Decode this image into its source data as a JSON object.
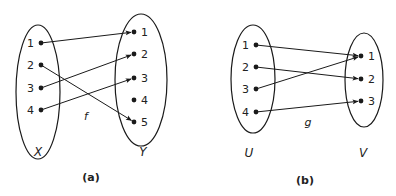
{
  "diagrams": [
    {
      "id": "a",
      "caption": "(a)",
      "function_label": "f",
      "domain": {
        "label": "X",
        "ellipse": {
          "cx": 38,
          "cy": 92,
          "rx": 22,
          "ry": 67
        },
        "elements": [
          {
            "label": "1",
            "x": 41,
            "y": 43
          },
          {
            "label": "2",
            "x": 41,
            "y": 65
          },
          {
            "label": "3",
            "x": 41,
            "y": 88
          },
          {
            "label": "4",
            "x": 41,
            "y": 110
          }
        ],
        "label_pos": {
          "x": 38,
          "y": 156
        }
      },
      "codomain": {
        "label": "Y",
        "ellipse": {
          "cx": 141,
          "cy": 80,
          "rx": 26,
          "ry": 66
        },
        "elements": [
          {
            "label": "1",
            "x": 134,
            "y": 32
          },
          {
            "label": "2",
            "x": 134,
            "y": 54
          },
          {
            "label": "3",
            "x": 134,
            "y": 78
          },
          {
            "label": "4",
            "x": 134,
            "y": 100
          },
          {
            "label": "5",
            "x": 134,
            "y": 122
          }
        ],
        "label_pos": {
          "x": 143,
          "y": 156
        }
      },
      "mapping": [
        {
          "from": "1",
          "to": "1"
        },
        {
          "from": "2",
          "to": "5"
        },
        {
          "from": "3",
          "to": "2"
        },
        {
          "from": "4",
          "to": "3"
        }
      ],
      "function_label_pos": {
        "x": 86,
        "y": 120
      },
      "caption_pos": {
        "x": 91,
        "y": 181
      }
    },
    {
      "id": "b",
      "caption": "(b)",
      "function_label": "g",
      "domain": {
        "label": "U",
        "ellipse": {
          "cx": 253,
          "cy": 79,
          "rx": 22,
          "ry": 54
        },
        "elements": [
          {
            "label": "1",
            "x": 256,
            "y": 45
          },
          {
            "label": "2",
            "x": 256,
            "y": 67
          },
          {
            "label": "3",
            "x": 256,
            "y": 89
          },
          {
            "label": "4",
            "x": 256,
            "y": 112
          }
        ],
        "label_pos": {
          "x": 249,
          "y": 157
        }
      },
      "codomain": {
        "label": "V",
        "ellipse": {
          "cx": 364,
          "cy": 80,
          "rx": 19,
          "ry": 47
        },
        "elements": [
          {
            "label": "1",
            "x": 361,
            "y": 56
          },
          {
            "label": "2",
            "x": 361,
            "y": 79
          },
          {
            "label": "3",
            "x": 361,
            "y": 101
          }
        ],
        "label_pos": {
          "x": 363,
          "y": 157
        }
      },
      "mapping": [
        {
          "from": "1",
          "to": "1"
        },
        {
          "from": "2",
          "to": "2"
        },
        {
          "from": "3",
          "to": "1"
        },
        {
          "from": "4",
          "to": "3"
        }
      ],
      "function_label_pos": {
        "x": 308,
        "y": 126
      },
      "caption_pos": {
        "x": 305,
        "y": 184
      }
    }
  ],
  "colors": {
    "stroke": "#1a1a1a",
    "text": "#222222",
    "background": "#ffffff"
  }
}
